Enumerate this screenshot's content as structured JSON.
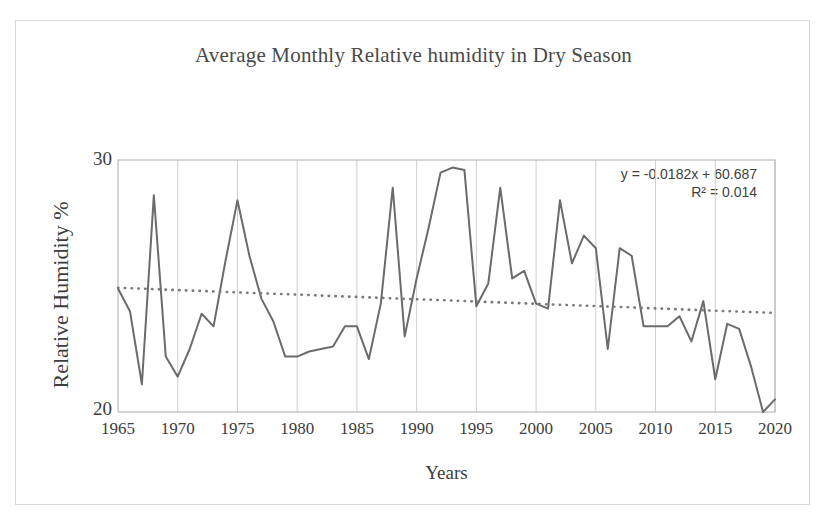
{
  "chart_data": {
    "type": "line",
    "title": "Average Monthly Relative humidity in Dry Season",
    "xlabel": "Years",
    "ylabel": "Relative Humidity %",
    "xlim": [
      1965,
      2020
    ],
    "ylim": [
      20,
      30
    ],
    "ytick_labels": [
      "30",
      "20"
    ],
    "xtick_labels": [
      "1965",
      "1970",
      "1975",
      "1980",
      "1985",
      "1990",
      "1995",
      "2000",
      "2005",
      "2010",
      "2015",
      "2020"
    ],
    "grid": "vertical",
    "legend": "none",
    "annotations": {
      "equation": "y = -0.0182x + 60.687",
      "r_squared": "R² = 0.014"
    },
    "series": [
      {
        "name": "Average Monthly Relative Humidity",
        "style": "solid",
        "color": "#6b6b6b",
        "x": [
          1965,
          1966,
          1967,
          1968,
          1969,
          1970,
          1971,
          1972,
          1973,
          1974,
          1975,
          1976,
          1977,
          1978,
          1979,
          1980,
          1981,
          1982,
          1983,
          1984,
          1985,
          1986,
          1987,
          1988,
          1989,
          1990,
          1991,
          1992,
          1993,
          1994,
          1995,
          1996,
          1997,
          1998,
          1999,
          2000,
          2001,
          2002,
          2003,
          2004,
          2005,
          2006,
          2007,
          2008,
          2009,
          2010,
          2011,
          2012,
          2013,
          2014,
          2015,
          2016,
          2017,
          2018,
          2019,
          2020
        ],
        "y": [
          24.9,
          24.0,
          21.1,
          28.6,
          22.2,
          21.4,
          22.5,
          23.9,
          23.4,
          26.0,
          28.4,
          26.2,
          24.5,
          23.6,
          22.2,
          22.2,
          22.4,
          22.5,
          22.6,
          23.4,
          23.4,
          22.1,
          24.3,
          28.9,
          23.0,
          25.3,
          27.3,
          29.5,
          29.7,
          29.6,
          24.2,
          25.1,
          28.9,
          25.3,
          25.6,
          24.3,
          24.1,
          28.4,
          25.9,
          27.0,
          26.5,
          22.5,
          26.5,
          26.2,
          23.4,
          23.4,
          23.4,
          23.8,
          22.8,
          24.4,
          21.3,
          23.5,
          23.3,
          21.8,
          20.0,
          20.5
        ]
      },
      {
        "name": "Linear trendline",
        "style": "dotted",
        "color": "#7a7a7a",
        "x": [
          1965,
          2020
        ],
        "y": [
          24.93,
          23.93
        ]
      }
    ]
  },
  "figure": {
    "background": "#ffffff",
    "border_color": "#d8d8d8",
    "plot_border_color": "#b9b9b9",
    "gridline_color": "#cfcfcf"
  }
}
